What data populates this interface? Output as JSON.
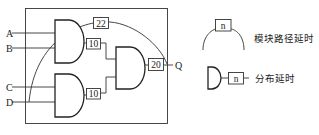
{
  "diagram": {
    "inputs": [
      "A",
      "B",
      "C",
      "D"
    ],
    "output": "Q",
    "delays": {
      "module_path": "22",
      "gate1": "10",
      "gate2": "10",
      "gate3": "20"
    },
    "legend": {
      "path_box": "n",
      "path_label": "模块路径延时",
      "dist_box": "n",
      "dist_label": "分布延时"
    }
  }
}
